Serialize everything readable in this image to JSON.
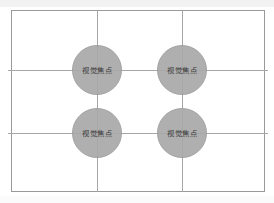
{
  "diagram": {
    "name": "rule-of-thirds-composition-grid",
    "frame": {
      "border_color": "#9a9a9a",
      "background_color": "#ffffff"
    },
    "grid": {
      "line_color": "#a6a6a6",
      "vertical_lines": 2,
      "horizontal_lines": 2,
      "cells": 9
    },
    "focal_points": [
      {
        "id": "top-left",
        "label": "视觉焦点"
      },
      {
        "id": "top-right",
        "label": "视觉焦点"
      },
      {
        "id": "bottom-left",
        "label": "视觉焦点"
      },
      {
        "id": "bottom-right",
        "label": "视觉焦点"
      }
    ],
    "marker_color": "#a9a9a9",
    "label_color": "#2b2b2b"
  }
}
